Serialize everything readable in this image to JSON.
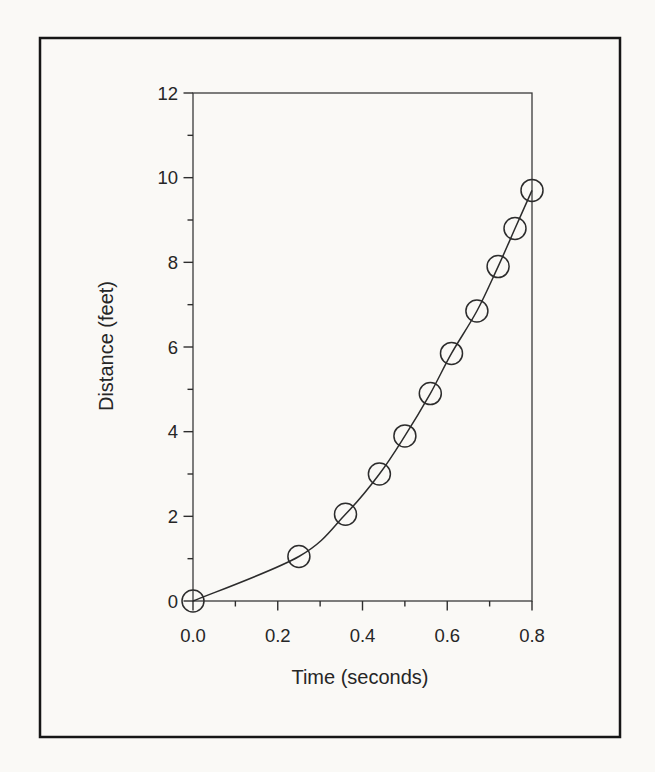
{
  "figure": {
    "kind": "scanned-book-figure",
    "border_color": "#161616",
    "paper_color": "#faf9f6",
    "ink_color": "#2c2c2c"
  },
  "chart_data": {
    "type": "scatter",
    "title": "",
    "xlabel": "Time (seconds)",
    "ylabel": "Distance (feet)",
    "xlim": [
      0,
      0.8
    ],
    "ylim": [
      0,
      12
    ],
    "grid": false,
    "legend": "none",
    "marker": "open-circle",
    "curve": "smooth line through all points",
    "x_major_ticks": [
      {
        "v": 0.0,
        "label": "0.0"
      },
      {
        "v": 0.2,
        "label": "0.2"
      },
      {
        "v": 0.4,
        "label": "0.4"
      },
      {
        "v": 0.6,
        "label": "0.6"
      },
      {
        "v": 0.8,
        "label": "0.8"
      }
    ],
    "x_minor_ticks": [
      0.1,
      0.3,
      0.5,
      0.7
    ],
    "y_major_ticks": [
      {
        "v": 0,
        "label": "0"
      },
      {
        "v": 2,
        "label": "2"
      },
      {
        "v": 4,
        "label": "4"
      },
      {
        "v": 6,
        "label": "6"
      },
      {
        "v": 8,
        "label": "8"
      },
      {
        "v": 10,
        "label": "10"
      },
      {
        "v": 12,
        "label": "12"
      }
    ],
    "y_minor_ticks": [
      1,
      3,
      5,
      7,
      9,
      11
    ],
    "points": [
      {
        "t": 0.0,
        "d": 0.0
      },
      {
        "t": 0.25,
        "d": 1.05
      },
      {
        "t": 0.36,
        "d": 2.05
      },
      {
        "t": 0.44,
        "d": 3.0
      },
      {
        "t": 0.5,
        "d": 3.9
      },
      {
        "t": 0.56,
        "d": 4.9
      },
      {
        "t": 0.61,
        "d": 5.85
      },
      {
        "t": 0.67,
        "d": 6.85
      },
      {
        "t": 0.72,
        "d": 7.9
      },
      {
        "t": 0.76,
        "d": 8.8
      },
      {
        "t": 0.8,
        "d": 9.7
      }
    ]
  },
  "layout_px": {
    "border": {
      "x": 40,
      "y": 38,
      "w": 580,
      "h": 699
    },
    "plot": {
      "x0": 193,
      "y0": 601,
      "x1": 532,
      "y1": 93
    },
    "marker_radius": 11,
    "major_tick_len": 9.5,
    "minor_tick_len": 5.5
  }
}
